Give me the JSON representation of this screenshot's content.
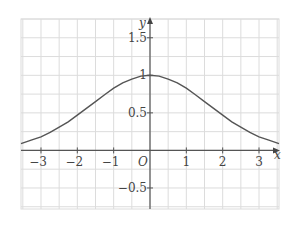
{
  "chart_data": {
    "type": "line",
    "title": "",
    "xlabel": "x",
    "ylabel": "y",
    "origin_label": "O",
    "xlim": [
      -3.55,
      3.55
    ],
    "ylim": [
      -0.78,
      1.75
    ],
    "grid": true,
    "grid_step_x": 0.5,
    "grid_step_y": 0.25,
    "x_ticks": [
      {
        "value": -3,
        "label": "−3"
      },
      {
        "value": -2,
        "label": "−2"
      },
      {
        "value": -1,
        "label": "−1"
      },
      {
        "value": 1,
        "label": "1"
      },
      {
        "value": 2,
        "label": "2"
      },
      {
        "value": 3,
        "label": "3"
      }
    ],
    "y_ticks": [
      {
        "value": 1.5,
        "label": "1.5"
      },
      {
        "value": 1,
        "label": "1"
      },
      {
        "value": 0.5,
        "label": "0.5"
      },
      {
        "value": -0.5,
        "label": "−0.5"
      }
    ],
    "series": [
      {
        "name": "curve",
        "x": [
          -3.55,
          -3.25,
          -3,
          -2.75,
          -2.5,
          -2.25,
          -2,
          -1.75,
          -1.5,
          -1.25,
          -1,
          -0.75,
          -0.5,
          -0.25,
          0,
          0.25,
          0.5,
          0.75,
          1,
          1.25,
          1.5,
          1.75,
          2,
          2.25,
          2.5,
          2.75,
          3,
          3.25,
          3.55
        ],
        "y": [
          0.09,
          0.14,
          0.18,
          0.24,
          0.31,
          0.38,
          0.47,
          0.56,
          0.65,
          0.74,
          0.83,
          0.9,
          0.95,
          0.99,
          1,
          0.99,
          0.95,
          0.9,
          0.83,
          0.74,
          0.65,
          0.56,
          0.47,
          0.38,
          0.31,
          0.24,
          0.18,
          0.14,
          0.09
        ]
      }
    ]
  }
}
